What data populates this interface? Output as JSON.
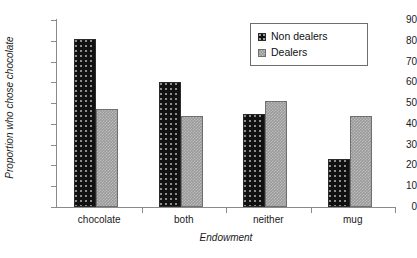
{
  "chart_data": {
    "type": "bar",
    "title": "",
    "xlabel": "Endowment",
    "ylabel": "Proportion who chose chocolate",
    "categories": [
      "chocolate",
      "both",
      "neither",
      "mug"
    ],
    "series": [
      {
        "name": "Non dealers",
        "values": [
          81,
          60,
          45,
          23
        ],
        "color": "#111111",
        "pattern": "dotted"
      },
      {
        "name": "Dealers",
        "values": [
          47,
          44,
          51,
          44
        ],
        "color": "#9a9a9a",
        "pattern": "checkered"
      }
    ],
    "ylim": [
      0,
      90
    ],
    "ytick_step": 10,
    "yticks": [
      0,
      10,
      20,
      30,
      40,
      50,
      60,
      70,
      80,
      90
    ],
    "ytick_labels": [
      "0",
      "10",
      "20",
      "30",
      "40",
      "50",
      "60",
      "70",
      "80",
      "90"
    ],
    "grid": false,
    "legend_position": "top-right",
    "legend_entries": [
      "Non dealers",
      "Dealers"
    ]
  }
}
